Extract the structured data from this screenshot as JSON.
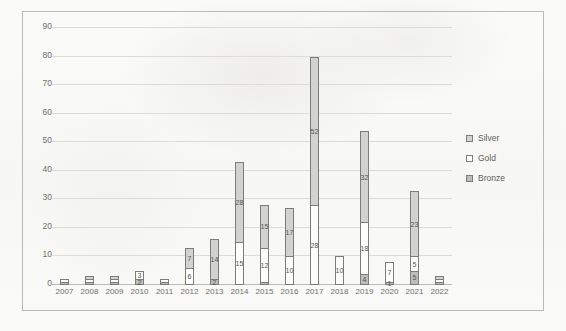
{
  "chart_data": {
    "type": "bar",
    "stacked": true,
    "title": "",
    "subtitle": "",
    "xlabel": "",
    "ylabel": "",
    "ylim": [
      0,
      90
    ],
    "ytick_step": 10,
    "yticks": [
      0,
      10,
      20,
      30,
      40,
      50,
      60,
      70,
      80,
      90
    ],
    "grid": true,
    "legend_position": "right",
    "categories": [
      "2007",
      "2008",
      "2009",
      "2010",
      "2011",
      "2012",
      "2013",
      "2014",
      "2015",
      "2016",
      "2017",
      "2018",
      "2019",
      "2020",
      "2021",
      "2022"
    ],
    "series": [
      {
        "name": "Bronze",
        "color": "#bdbdba",
        "values": [
          1,
          1,
          1,
          2,
          1,
          0,
          2,
          0,
          1,
          0,
          0,
          0,
          4,
          1,
          5,
          1
        ],
        "labels": [
          "",
          "",
          "",
          "2",
          "",
          "",
          "2",
          "",
          "",
          "",
          "",
          "",
          "4",
          "1",
          "5",
          ""
        ]
      },
      {
        "name": "Gold",
        "color": "#fdfdfc",
        "values": [
          1,
          1,
          1,
          3,
          1,
          6,
          0,
          15,
          12,
          10,
          28,
          10,
          18,
          7,
          5,
          1
        ],
        "labels": [
          "",
          "",
          "",
          "3",
          "",
          "6",
          "",
          "15",
          "12",
          "10",
          "28",
          "10",
          "18",
          "7",
          "5",
          ""
        ]
      },
      {
        "name": "Silver",
        "color": "#d2d2cf",
        "values": [
          0,
          1,
          1,
          0,
          0,
          7,
          14,
          28,
          15,
          17,
          52,
          0,
          32,
          0,
          23,
          1
        ],
        "labels": [
          "",
          "",
          "",
          "",
          "",
          "7",
          "14",
          "28",
          "15",
          "17",
          "52",
          "",
          "32",
          "",
          "23",
          ""
        ]
      }
    ],
    "totals": [
      2,
      3,
      3,
      5,
      2,
      13,
      16,
      43,
      28,
      27,
      80,
      10,
      54,
      8,
      33,
      2
    ]
  },
  "legend": {
    "items": [
      {
        "label": "Silver",
        "swatch": "silver"
      },
      {
        "label": "Gold",
        "swatch": "gold"
      },
      {
        "label": "Bronze",
        "swatch": "bronze"
      }
    ]
  }
}
